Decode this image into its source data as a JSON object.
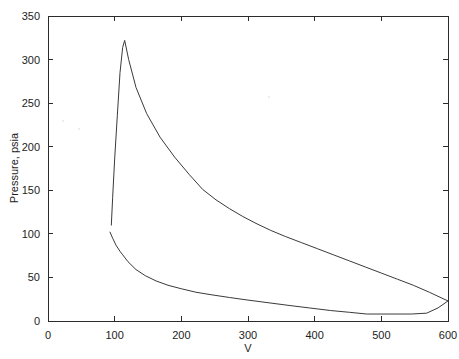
{
  "page": {
    "header_text": "",
    "background_color": "#ffffff",
    "ink_color": "#2b2b2b"
  },
  "chart_data": {
    "type": "line",
    "title": "",
    "subtitle": "",
    "xlabel": "V",
    "ylabel": "Pressure, psia",
    "xlim": [
      0,
      600
    ],
    "ylim": [
      0,
      350
    ],
    "xticks": [
      0,
      100,
      200,
      300,
      400,
      500,
      600
    ],
    "yticks": [
      0,
      50,
      100,
      150,
      200,
      250,
      300,
      350
    ],
    "xtick_labels": [
      "0",
      "100",
      "200",
      "300",
      "400",
      "500",
      "600"
    ],
    "ytick_labels": [
      "0",
      "50",
      "100",
      "150",
      "200",
      "250",
      "300",
      "350"
    ],
    "grid": false,
    "legend": false,
    "legend_position": "none",
    "line_color": "#3a3a3a",
    "series": [
      {
        "name": "expansion-stroke",
        "x": [
          95,
          97,
          100,
          104,
          108,
          112,
          115,
          121,
          132,
          148,
          168,
          190,
          212,
          232,
          252,
          272,
          292,
          312,
          334,
          356,
          380,
          404,
          428,
          452,
          476,
          500,
          524,
          548,
          572,
          600
        ],
        "y": [
          110,
          142,
          186,
          236,
          285,
          314,
          322,
          300,
          268,
          238,
          211,
          188,
          168,
          151,
          139,
          129,
          120,
          112,
          104,
          97,
          90,
          83,
          76,
          69,
          62,
          55,
          48,
          41,
          33,
          23
        ]
      },
      {
        "name": "compression-stroke",
        "x": [
          93,
          97,
          102,
          108,
          112,
          120,
          132,
          146,
          162,
          180,
          200,
          222,
          246,
          272,
          300,
          330,
          360,
          392,
          424,
          452,
          478,
          500,
          522,
          545,
          568,
          585,
          600
        ],
        "y": [
          102,
          95,
          87,
          80,
          76,
          68,
          59,
          52,
          46,
          41,
          37,
          33,
          30,
          27,
          24,
          21,
          18,
          15,
          12,
          10,
          8,
          8,
          8,
          8,
          9,
          15,
          23
        ]
      }
    ],
    "annotations": {
      "peak_pressure": 322,
      "peak_volume": 115,
      "min_volume": 93,
      "max_volume": 600,
      "closing_pressure": 23
    }
  }
}
